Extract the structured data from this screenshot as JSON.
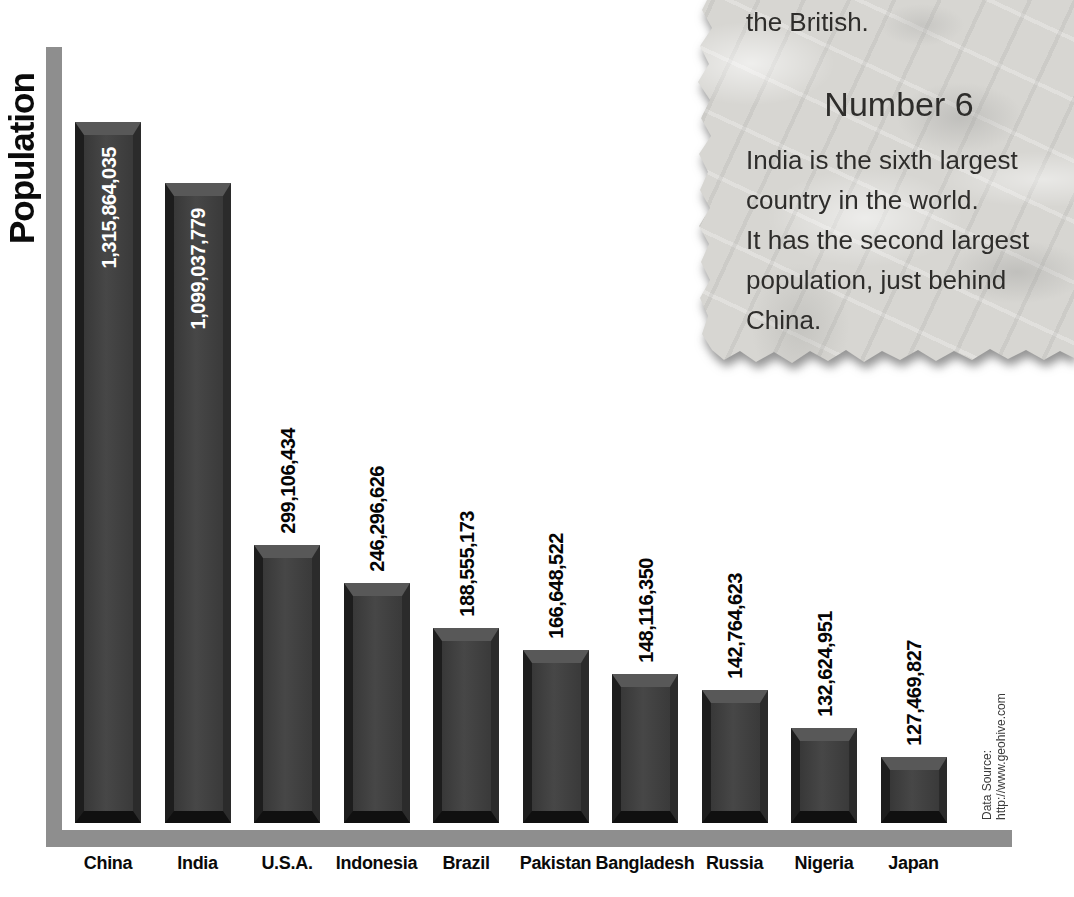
{
  "chart_data": {
    "type": "bar",
    "title": "",
    "xlabel": "",
    "ylabel": "Population",
    "legend": "none",
    "grid": false,
    "categories": [
      "China",
      "India",
      "U.S.A.",
      "Indonesia",
      "Brazil",
      "Pakistan",
      "Bangladesh",
      "Russia",
      "Nigeria",
      "Japan"
    ],
    "values": [
      1315864035,
      1099037779,
      299106434,
      246296626,
      188555173,
      166648522,
      148116350,
      142764623,
      132624951,
      127469827
    ],
    "value_labels": [
      "1,315,864,035",
      "1,099,037,779",
      "299,106,434",
      "246,296,626",
      "188,555,173",
      "166,648,522",
      "148,116,350",
      "142,764,623",
      "132,624,951",
      "127,469,827"
    ],
    "source_note": "Data Source:\nhttp://www.geohive.com",
    "layout_hints": {
      "bar_color": "#3e3e3e",
      "axis_color": "#8e8e8e",
      "value_label_inside_bar": [
        true,
        true,
        false,
        false,
        false,
        false,
        false,
        false,
        false,
        false
      ],
      "bar_visual_heights_px": [
        701,
        640,
        278,
        240,
        195,
        173,
        149,
        133,
        95,
        66
      ],
      "bar_slot_start_px": 108,
      "bar_slot_spacing_px": 89.5,
      "bar_baseline_y_px": 823,
      "value_label_rotation_deg": -90
    }
  },
  "note": {
    "top_fragment": "the British.",
    "heading": "Number 6",
    "body": "India is the sixth largest\ncountry in the world.\nIt has the second largest\npopulation, just behind\nChina."
  }
}
